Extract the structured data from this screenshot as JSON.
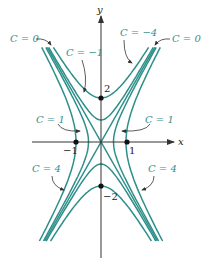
{
  "figure": {
    "curve_color": "#2e8f8a",
    "label_color": "#3a8f8c",
    "axis_color": "#333333",
    "axes": {
      "x_label": "x",
      "y_label": "y"
    },
    "ticks": {
      "x_neg": "−1",
      "x_pos": "1",
      "y_pos": "2",
      "y_neg": "−2"
    },
    "labels": [
      {
        "text": "C = 0",
        "x": 10,
        "y": 42
      },
      {
        "text": "C = −1",
        "x": 66,
        "y": 56
      },
      {
        "text": "C = −4",
        "x": 120,
        "y": 36
      },
      {
        "text": "C = 0",
        "x": 172,
        "y": 42
      },
      {
        "text": "C = 1",
        "x": 36,
        "y": 123
      },
      {
        "text": "C = 1",
        "x": 145,
        "y": 123
      },
      {
        "text": "C = 4",
        "x": 32,
        "y": 172
      },
      {
        "text": "C = 4",
        "x": 148,
        "y": 172
      }
    ],
    "level_values": [
      -4,
      -1,
      0,
      1,
      4
    ]
  }
}
